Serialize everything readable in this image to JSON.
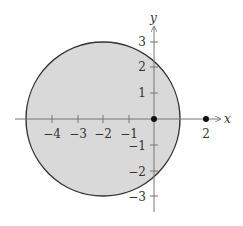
{
  "figure": {
    "x_axis_label": "x",
    "y_axis_label": "y",
    "x_tick_labels": [
      "−4",
      "−3",
      "−2",
      "−1",
      "2"
    ],
    "y_tick_labels": [
      "3",
      "2",
      "1",
      "−1",
      "−2",
      "−3"
    ],
    "circle": {
      "center": [
        -2,
        0
      ],
      "radius": 3,
      "fill": "#d9d9d9",
      "stroke": "#333333"
    },
    "points": [
      {
        "x": 0,
        "y": 0
      },
      {
        "x": 2,
        "y": 0
      }
    ]
  }
}
